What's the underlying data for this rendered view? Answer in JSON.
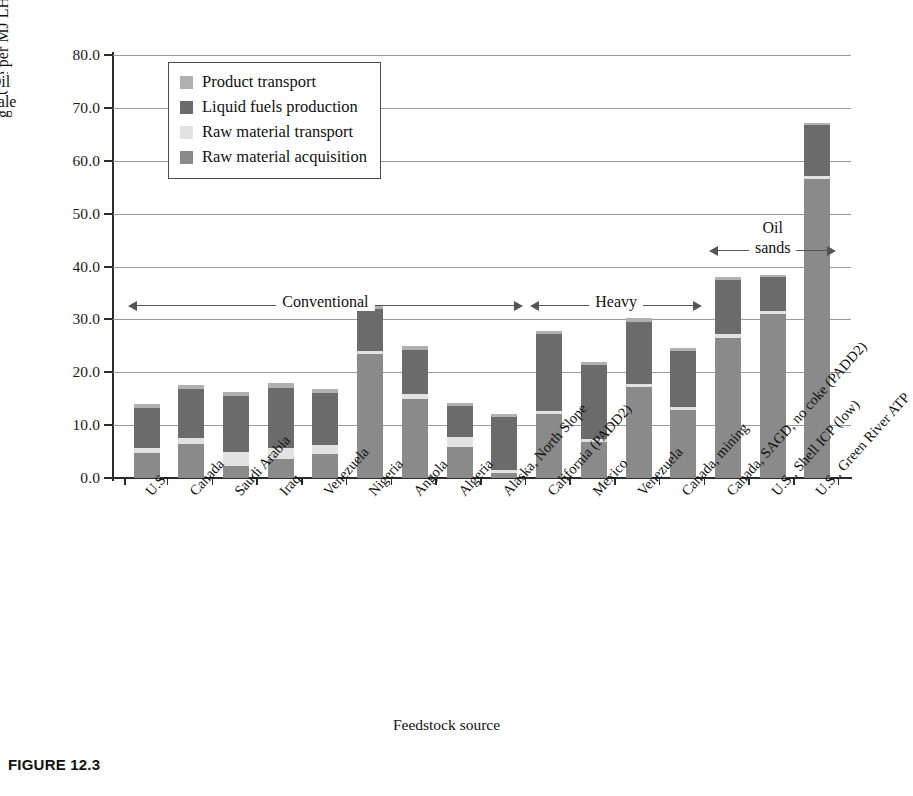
{
  "figure": {
    "caption": "FIGURE 12.3",
    "xaxis_title": "Feedstock source",
    "yaxis_title_prefix": "g CO",
    "yaxis_title_sub": "2",
    "yaxis_title_suffix": "e per MJ LHV of gasoline dispensed"
  },
  "legend": {
    "items": [
      {
        "label": "Product transport",
        "color": "#b0b0b0"
      },
      {
        "label": "Liquid fuels production",
        "color": "#6b6b6b"
      },
      {
        "label": "Raw material transport",
        "color": "#e2e2e2"
      },
      {
        "label": "Raw material acquisition",
        "color": "#8a8a8a"
      }
    ]
  },
  "annotations": [
    {
      "text": "Conventional",
      "start_index": 0,
      "end_index": 8
    },
    {
      "text": "Heavy",
      "start_index": 9,
      "end_index": 12
    },
    {
      "text": "Oil sands",
      "start_index": 13,
      "end_index": 15
    },
    {
      "text": "Oil shale",
      "start_index": 16,
      "end_index": 16
    }
  ],
  "chart_data": {
    "type": "bar",
    "subtype": "stacked",
    "title": "",
    "xlabel": "Feedstock source",
    "ylabel": "g CO2e per MJ LHV of gasoline dispensed",
    "ylim": [
      0,
      80
    ],
    "yticks": [
      "0.0",
      "10.0",
      "20.0",
      "30.0",
      "40.0",
      "50.0",
      "60.0",
      "70.0",
      "80.0"
    ],
    "grid": true,
    "legend_position": "upper-left-inside",
    "categories": [
      "U.S.",
      "Canada",
      "Saudi Arabia",
      "Iraq",
      "Venezuela",
      "Nigeria",
      "Angola",
      "Algeria",
      "Alaska, North Slope",
      "California (PADD2)",
      "Mexico",
      "Venezuela",
      "Canada, mining",
      "Canada, SAGD, no coke (PADD2)",
      "U.S., Shell ICP (low)",
      "U.S., Green River ATP"
    ],
    "series": [
      {
        "name": "Raw material acquisition",
        "color": "#8a8a8a",
        "values": [
          4.7,
          6.5,
          2.3,
          3.6,
          4.6,
          23.5,
          14.9,
          5.9,
          0.9,
          12.2,
          6.8,
          17.2,
          12.9,
          26.5,
          31.0,
          56.5
        ]
      },
      {
        "name": "Raw material transport",
        "color": "#e2e2e2",
        "values": [
          0.9,
          1.0,
          2.7,
          2.1,
          1.6,
          0.6,
          0.9,
          1.8,
          0.6,
          0.4,
          0.5,
          0.5,
          0.6,
          0.7,
          0.5,
          0.6
        ]
      },
      {
        "name": "Liquid fuels production",
        "color": "#6b6b6b",
        "values": [
          7.6,
          9.3,
          10.5,
          11.4,
          9.8,
          7.8,
          8.5,
          5.9,
          10.0,
          14.7,
          14.0,
          11.9,
          10.5,
          10.3,
          6.5,
          9.7
        ]
      },
      {
        "name": "Product transport",
        "color": "#b0b0b0",
        "values": [
          0.8,
          0.7,
          0.8,
          0.8,
          0.9,
          0.7,
          0.7,
          0.5,
          0.6,
          0.5,
          0.7,
          0.7,
          0.5,
          0.5,
          0.4,
          0.4
        ]
      }
    ],
    "totals": [
      14.0,
      17.5,
      16.3,
      17.9,
      16.9,
      32.6,
      25.0,
      14.1,
      12.1,
      27.8,
      22.0,
      30.3,
      24.5,
      38.0,
      38.4,
      67.2
    ]
  }
}
